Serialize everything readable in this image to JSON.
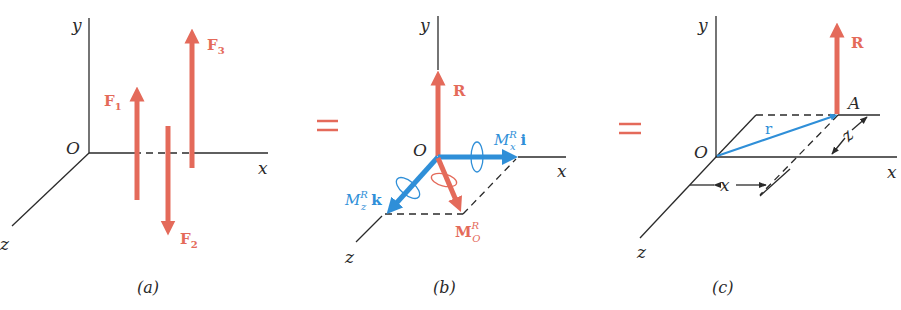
{
  "colors": {
    "force_red": "#e46a5a",
    "moment_blue": "#2f8fd8",
    "axis_black": "#2a2a2a",
    "background": "#ffffff"
  },
  "equals_sign": "=",
  "panels": [
    {
      "caption": "(a)",
      "axes": {
        "y": "y",
        "x": "x",
        "z": "z",
        "origin": "O"
      },
      "forces": [
        {
          "label": "F",
          "subscript": "1",
          "direction": "up"
        },
        {
          "label": "F",
          "subscript": "2",
          "direction": "down"
        },
        {
          "label": "F",
          "subscript": "3",
          "direction": "up"
        }
      ]
    },
    {
      "caption": "(b)",
      "axes": {
        "y": "y",
        "x": "x",
        "z": "z",
        "origin": "O"
      },
      "resultant": {
        "label": "R"
      },
      "moments": {
        "mx": {
          "symbol": "M",
          "superscript": "R",
          "subscript": "x",
          "unit_vector": "i"
        },
        "mz": {
          "symbol": "M",
          "superscript": "R",
          "subscript": "z",
          "unit_vector": "k"
        },
        "mo": {
          "symbol": "M",
          "superscript": "R",
          "subscript": "O"
        }
      }
    },
    {
      "caption": "(c)",
      "axes": {
        "y": "y",
        "x": "x",
        "z": "z",
        "origin": "O"
      },
      "resultant": {
        "label": "R"
      },
      "point": "A",
      "position_vector": "r",
      "dimensions": {
        "x": "x",
        "z": "z"
      }
    }
  ]
}
